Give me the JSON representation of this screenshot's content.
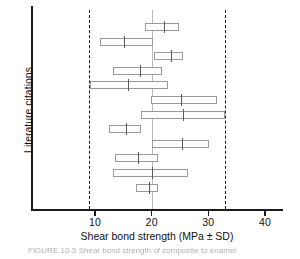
{
  "chart_data": {
    "type": "bar",
    "title": "",
    "xlabel": "Shear bond strength (MPa ± SD)",
    "ylabel": "Literature citations",
    "orientation": "horizontal",
    "grid": false,
    "legend": "none",
    "xlim": [
      0,
      43
    ],
    "xticks": [
      10,
      20,
      30,
      40
    ],
    "xticklabels": [
      "10",
      "20",
      "30",
      "40"
    ],
    "reference_lines": [
      {
        "name": "lower-reference",
        "value": 9.0,
        "style": "dashed"
      },
      {
        "name": "upper-reference",
        "value": 32.9,
        "style": "dashed"
      },
      {
        "name": "center-reference",
        "value": 20.0,
        "style": "solid-light"
      }
    ],
    "categories": [
      "Citation 1",
      "Citation 2",
      "Citation 3",
      "Citation 4",
      "Citation 5",
      "Citation 6",
      "Citation 7",
      "Citation 8",
      "Citation 9",
      "Citation 10",
      "Citation 11",
      "Citation 12"
    ],
    "series": [
      {
        "name": "Shear bond strength (mean ± SD)",
        "means": [
          22.1,
          15.1,
          23.4,
          17.9,
          15.8,
          25.1,
          25.5,
          15.4,
          25.3,
          17.5,
          20.0,
          19.5
        ],
        "low": [
          18.9,
          10.9,
          20.4,
          13.1,
          9.1,
          19.8,
          18.2,
          12.4,
          20.0,
          13.5,
          13.1,
          17.2
        ],
        "high": [
          24.8,
          20.2,
          25.6,
          21.9,
          22.8,
          31.5,
          32.9,
          18.1,
          30.1,
          21.2,
          26.5,
          21.2
        ]
      }
    ]
  },
  "axes": {
    "x_title": "Shear bond strength (MPa ± SD)",
    "y_title": "Literature citations"
  },
  "caption": {
    "text": "FIGURE  10-5   Shear bond strength of composite to enamel"
  }
}
